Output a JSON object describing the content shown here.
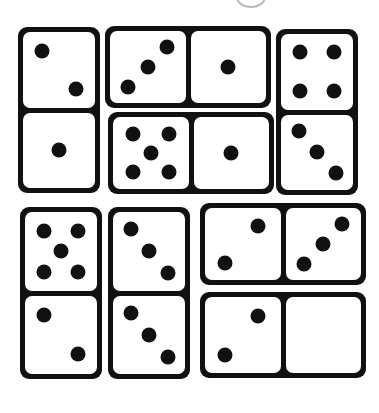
{
  "canvas": {
    "width": 379,
    "height": 413,
    "background": "#ffffff",
    "ink": "#111111",
    "face": "#ffffff",
    "watermark_color": "#b9b9b9"
  },
  "watermark": {
    "name": "partial-circle-watermark",
    "x": 236,
    "y": -14,
    "width": 30,
    "height": 22
  },
  "dominoes": [
    {
      "id": "domino-1",
      "orientation": "vertical",
      "x": 18,
      "y": 27,
      "width": 82,
      "height": 166,
      "halves": [
        {
          "pips": 2,
          "pattern": "diagonal-2-tlbr"
        },
        {
          "pips": 1,
          "pattern": "center-1"
        }
      ],
      "total": 3
    },
    {
      "id": "domino-2",
      "orientation": "horizontal",
      "x": 105,
      "y": 26,
      "width": 166,
      "height": 82,
      "halves": [
        {
          "pips": 3,
          "pattern": "diagonal-3-trbl"
        },
        {
          "pips": 1,
          "pattern": "center-1"
        }
      ],
      "total": 4
    },
    {
      "id": "domino-3",
      "orientation": "horizontal",
      "x": 108,
      "y": 112,
      "width": 166,
      "height": 82,
      "halves": [
        {
          "pips": 5,
          "pattern": "quincunx-5"
        },
        {
          "pips": 1,
          "pattern": "center-1"
        }
      ],
      "total": 6
    },
    {
      "id": "domino-4",
      "orientation": "vertical",
      "x": 276,
      "y": 29,
      "width": 82,
      "height": 166,
      "halves": [
        {
          "pips": 4,
          "pattern": "corners-4"
        },
        {
          "pips": 3,
          "pattern": "diagonal-3-tlbr"
        }
      ],
      "total": 7
    },
    {
      "id": "domino-5",
      "orientation": "vertical",
      "x": 20,
      "y": 207,
      "width": 82,
      "height": 172,
      "halves": [
        {
          "pips": 5,
          "pattern": "quincunx-5"
        },
        {
          "pips": 2,
          "pattern": "diagonal-2-tlbr"
        }
      ],
      "total": 7
    },
    {
      "id": "domino-6",
      "orientation": "vertical",
      "x": 108,
      "y": 207,
      "width": 82,
      "height": 172,
      "halves": [
        {
          "pips": 3,
          "pattern": "diagonal-3-tlbr"
        },
        {
          "pips": 3,
          "pattern": "diagonal-3-tlbr"
        }
      ],
      "total": 6
    },
    {
      "id": "domino-7",
      "orientation": "horizontal",
      "x": 200,
      "y": 203,
      "width": 166,
      "height": 82,
      "halves": [
        {
          "pips": 2,
          "pattern": "diagonal-2-trbl"
        },
        {
          "pips": 3,
          "pattern": "diagonal-3-trbl"
        }
      ],
      "total": 5
    },
    {
      "id": "domino-8",
      "orientation": "horizontal",
      "x": 200,
      "y": 292,
      "width": 166,
      "height": 86,
      "halves": [
        {
          "pips": 2,
          "pattern": "diagonal-2-trbl"
        },
        {
          "pips": 0,
          "pattern": "blank-0"
        }
      ],
      "total": 2
    }
  ],
  "pip_patterns": {
    "blank-0": [],
    "center-1": [
      [
        50,
        50
      ]
    ],
    "diagonal-2-tlbr": [
      [
        27,
        25
      ],
      [
        73,
        75
      ]
    ],
    "diagonal-2-trbl": [
      [
        70,
        25
      ],
      [
        26,
        76
      ]
    ],
    "diagonal-3-tlbr": [
      [
        25,
        22
      ],
      [
        50,
        50
      ],
      [
        76,
        78
      ]
    ],
    "diagonal-3-trbl": [
      [
        75,
        22
      ],
      [
        50,
        50
      ],
      [
        24,
        78
      ]
    ],
    "corners-4": [
      [
        26,
        24
      ],
      [
        74,
        24
      ],
      [
        26,
        76
      ],
      [
        74,
        76
      ]
    ],
    "quincunx-5": [
      [
        26,
        24
      ],
      [
        74,
        24
      ],
      [
        50,
        50
      ],
      [
        26,
        76
      ],
      [
        74,
        76
      ]
    ]
  },
  "pip_size": {
    "vertical_half": 15,
    "horizontal_half": 15
  }
}
